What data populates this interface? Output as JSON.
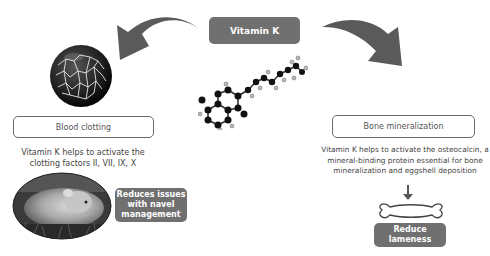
{
  "center": {
    "title": "Vitamin K",
    "molecule_icon": "vitamin-k-molecule-icon"
  },
  "left_branch": {
    "heading": "Blood clotting",
    "description_line1": "Vitamin K helps to activate the",
    "description_line2": "clotting factors II, VII, IX, X",
    "image_top": "blood-clot-fibrin-icon",
    "image_bottom": "piglet-photo",
    "outcome_line1": "Reduces issues",
    "outcome_line2": "with navel",
    "outcome_line3": "management"
  },
  "right_branch": {
    "heading": "Bone mineralization",
    "description_line1": "Vitamin K helps to activate the osteocalcin, a",
    "description_line2": "mineral-binding protein essential for bone",
    "description_line3": "mineralization and eggshell deposition",
    "icon": "bone-icon",
    "outcome_line1": "Reduce",
    "outcome_line2": "lameness"
  },
  "colors": {
    "box_fill": "#707070",
    "arrow_fill": "#5a5a5a",
    "outline": "#6a6a6a",
    "background": "#ffffff"
  }
}
